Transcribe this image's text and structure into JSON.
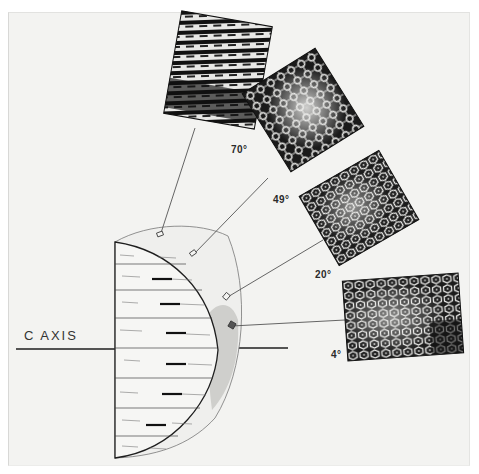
{
  "figure": {
    "axis_label": "C AXIS",
    "micrographs": [
      {
        "id": "m70",
        "angle_label": "70°",
        "texture": "striated"
      },
      {
        "id": "m49",
        "angle_label": "49°",
        "texture": "dendritic"
      },
      {
        "id": "m20",
        "angle_label": "20°",
        "texture": "hexagonal-network"
      },
      {
        "id": "m4",
        "angle_label": "4°",
        "texture": "hexagonal-network"
      }
    ],
    "colors": {
      "background": "#f3f3f1",
      "ink": "#1e1e1e",
      "shade": "#c9c9c5"
    }
  }
}
